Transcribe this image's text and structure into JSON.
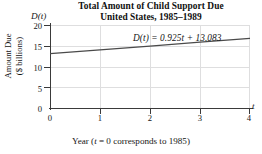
{
  "chart_data": {
    "type": "line",
    "title": "Total Amount of Child Support Due",
    "subtitle": "United States, 1985–1989",
    "title_line1": "Total Amount of Child Support Due",
    "title_line2": "United States, 1985–1989",
    "xlabel": "Year (t = 0 corresponds to 1985)",
    "ylabel": "Amount Due",
    "ylabel_line1": "Amount Due",
    "ylabel_line2": "($ billions)",
    "x_axis_name": "t",
    "y_axis_name": "D(t)",
    "annotation": "D(t) = 0.925t + 13.083",
    "equation": {
      "full": "D(t) = 0.925t + 13.083",
      "slope": 0.925,
      "intercept": 13.083,
      "lhs": "D(t)",
      "rhs": "0.925t + 13.083"
    },
    "xlim": [
      0,
      4
    ],
    "ylim": [
      0,
      20
    ],
    "xticks": [
      0,
      1,
      2,
      3,
      4
    ],
    "xtick_labels": [
      "0",
      "1",
      "2",
      "3",
      "4"
    ],
    "yticks": [
      0,
      5,
      10,
      15,
      20
    ],
    "ytick_labels": [
      "0",
      "5",
      "10",
      "15",
      "20"
    ],
    "grid": true,
    "grid_color": "#dededf",
    "legend": false,
    "line_color": "#4a4a4a",
    "axis_color": "#3a3a3a",
    "series": [
      {
        "name": "D(t) = 0.925t + 13.083",
        "x": [
          0,
          1,
          2,
          3,
          4
        ],
        "values": [
          13.083,
          14.008,
          14.933,
          15.858,
          16.783
        ]
      }
    ]
  },
  "axis_names": {
    "y": "D(t)",
    "x": "t"
  },
  "ticks": {
    "y_labels": [
      "20",
      "15",
      "10",
      "5",
      "0"
    ],
    "x_labels": [
      "0",
      "1",
      "2",
      "3",
      "4"
    ]
  },
  "caption": {
    "prefix": "Year (",
    "var": "t",
    "suffix": " = 0 corresponds to 1985)"
  },
  "annotation": {
    "lhs": "D(t)",
    "body": " = 0.925t + 13.083"
  },
  "colors": {
    "line": "#4a4a4a",
    "axis": "#3a3a3a",
    "grid": "#dededf",
    "text": "#151515",
    "background": "#ffffff"
  }
}
